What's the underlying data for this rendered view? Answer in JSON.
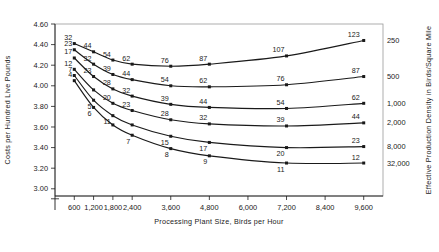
{
  "chart_data": {
    "type": "line",
    "title": "",
    "xlabel": "Processing Plant Size, Birds per Hour",
    "ylabel": "Costs per Hundred Live Pounds",
    "y2label": "Effective Production Density in Birds/Square Mile",
    "x": [
      600,
      1200,
      1800,
      2400,
      3600,
      4800,
      7200,
      9600
    ],
    "xticks": [
      "600",
      "1,200",
      "1,800",
      "2,400",
      "3,600",
      "4,800",
      "6,000",
      "7,200",
      "8,400",
      "9,600"
    ],
    "xtick_values": [
      600,
      1200,
      1800,
      2400,
      3600,
      4800,
      6000,
      7200,
      8400,
      9600
    ],
    "xlim": [
      0,
      10200
    ],
    "yticks": [
      "3.00",
      "3.20",
      "3.40",
      "3.60",
      "3.80",
      "4.00",
      "4.20",
      "4.40",
      "4.60"
    ],
    "ytick_values": [
      3.0,
      3.2,
      3.4,
      3.6,
      3.8,
      4.0,
      4.2,
      4.4,
      4.6
    ],
    "ylim": [
      2.93,
      4.6
    ],
    "axis_break": true,
    "grid": false,
    "legend_position": "right-axis",
    "series": [
      {
        "name": "250",
        "right_label": "250",
        "values": [
          4.41,
          4.33,
          4.25,
          4.21,
          4.19,
          4.21,
          4.29,
          4.44
        ],
        "point_labels": [
          "32",
          "44",
          "54",
          "62",
          "76",
          "87",
          "107",
          "123"
        ]
      },
      {
        "name": "500",
        "right_label": "500",
        "values": [
          4.35,
          4.21,
          4.11,
          4.06,
          4.0,
          3.99,
          4.01,
          4.09
        ],
        "point_labels": [
          "23",
          "32",
          "39",
          "44",
          "54",
          "62",
          "76",
          "87"
        ]
      },
      {
        "name": "1,000",
        "right_label": "1,000",
        "values": [
          4.27,
          4.09,
          3.97,
          3.9,
          3.82,
          3.79,
          3.78,
          3.83
        ],
        "point_labels": [
          "17",
          "23",
          "28",
          "32",
          "39",
          "44",
          "54",
          "62"
        ]
      },
      {
        "name": "2,000",
        "right_label": "2,000",
        "values": [
          4.16,
          3.96,
          3.83,
          3.76,
          3.67,
          3.63,
          3.61,
          3.64
        ],
        "point_labels": [
          "12",
          "",
          "20",
          "23",
          "28",
          "32",
          "39",
          "44"
        ]
      },
      {
        "name": "8,000",
        "right_label": "8,000",
        "values": [
          4.1,
          3.86,
          3.71,
          3.62,
          3.51,
          3.45,
          3.4,
          3.41
        ],
        "point_labels": [
          "7",
          "5",
          "11",
          "",
          "15",
          "17",
          "20",
          "23"
        ]
      },
      {
        "name": "32,000",
        "right_label": "32,000",
        "values": [
          4.05,
          3.79,
          3.62,
          3.52,
          3.39,
          3.32,
          3.25,
          3.25
        ],
        "point_labels": [
          "4",
          "6",
          "",
          "7",
          "8",
          "9",
          "11",
          "12"
        ]
      }
    ],
    "left_edge_labels": [
      "32",
      "23",
      "17",
      "12",
      "7",
      "4"
    ],
    "right_edge_labels": [
      "250",
      "500",
      "1,000",
      "2,000",
      "8,000",
      "32,000"
    ]
  }
}
